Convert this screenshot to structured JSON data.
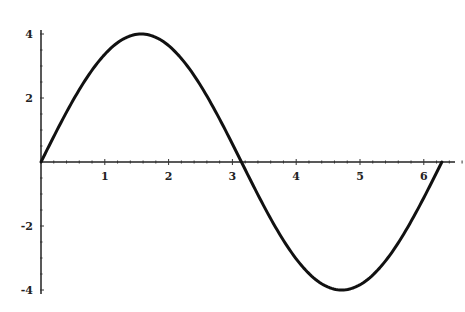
{
  "chart_data": {
    "type": "line",
    "title": "",
    "xlabel": "",
    "ylabel": "",
    "function": "4 sin(x)",
    "xlim": [
      0,
      6.2832
    ],
    "ylim": [
      -4,
      4
    ],
    "x_ticks": [
      1,
      2,
      3,
      4,
      5,
      6
    ],
    "x_tick_labels": [
      "1",
      "2",
      "3",
      "4",
      "5",
      "6"
    ],
    "y_ticks": [
      -4,
      -2,
      2,
      4
    ],
    "y_tick_labels": [
      "-4",
      "-2",
      "2",
      "4"
    ],
    "grid": false,
    "legend": null,
    "series": [
      {
        "name": "4 sin(x)",
        "x": [
          0,
          0.5,
          1.0,
          1.5708,
          2.0,
          2.5,
          3.0,
          3.1416,
          3.5,
          4.0,
          4.7124,
          5.0,
          5.5,
          6.0,
          6.2832
        ],
        "values": [
          0,
          1.92,
          3.37,
          4.0,
          3.64,
          2.39,
          0.56,
          0,
          -1.4,
          -3.03,
          -4.0,
          -3.84,
          -2.83,
          -1.12,
          0
        ]
      }
    ],
    "color": "#111111"
  }
}
